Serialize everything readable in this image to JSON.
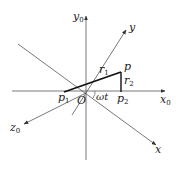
{
  "diagram": {
    "type": "coordinate-frame",
    "origin": {
      "label": "O",
      "x": 86,
      "y": 93
    },
    "axes": [
      {
        "name": "x0",
        "label": "x",
        "sub": "0",
        "from": [
          12,
          91
        ],
        "to": [
          165,
          91
        ]
      },
      {
        "name": "y0",
        "label": "y",
        "sub": "0",
        "from": [
          86,
          160
        ],
        "to": [
          86,
          16
        ]
      },
      {
        "name": "z0",
        "label": "z",
        "sub": "0",
        "from": [
          86,
          93
        ],
        "to": [
          24,
          124
        ]
      },
      {
        "name": "x",
        "label": "x",
        "sub": "",
        "from": [
          18,
          44
        ],
        "to": [
          156,
          145
        ]
      },
      {
        "name": "y",
        "label": "y",
        "sub": "",
        "from": [
          86,
          93
        ],
        "to": [
          126,
          30
        ]
      }
    ],
    "points": [
      {
        "name": "p",
        "label": "p",
        "sub": "",
        "x": 121,
        "y": 72
      },
      {
        "name": "p1",
        "label": "p",
        "sub": "1",
        "x": 64,
        "y": 92
      },
      {
        "name": "p2",
        "label": "p",
        "sub": "2",
        "x": 121,
        "y": 92
      }
    ],
    "segments": [
      {
        "name": "r1",
        "label": "r",
        "sub": "1",
        "from": "p1",
        "to": "p"
      },
      {
        "name": "r2",
        "label": "r",
        "sub": "2",
        "from": "p",
        "to": "p2"
      }
    ],
    "angle": {
      "label": "ωt"
    }
  }
}
